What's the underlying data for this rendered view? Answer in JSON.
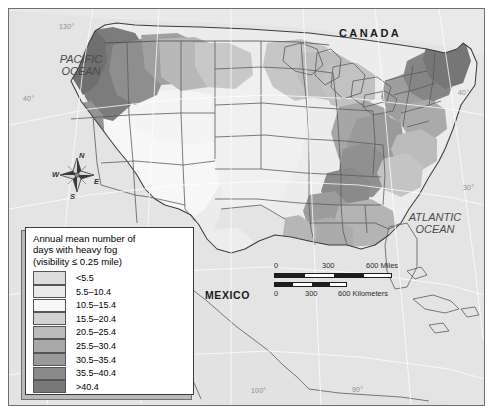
{
  "map": {
    "title_country_labels": [
      {
        "name": "CANADA",
        "x": 352,
        "y": 26,
        "style": "country"
      },
      {
        "name": "MEXICO",
        "x": 213,
        "y": 288,
        "style": "country-tight"
      }
    ],
    "ocean_labels": [
      {
        "name": "PACIFIC OCEAN",
        "line1": "PACIFIC",
        "line2": "OCEAN",
        "x": 30,
        "y": 52
      },
      {
        "name": "ATLANTIC OCEAN",
        "line1": "ATLANTIC",
        "line2": "OCEAN",
        "x": 415,
        "y": 215
      }
    ],
    "graticule_labels": [
      {
        "text": "130°",
        "x": 58,
        "y": 22
      },
      {
        "text": "40°",
        "x": 22,
        "y": 93
      },
      {
        "text": "40°",
        "x": 457,
        "y": 88
      },
      {
        "text": "30°",
        "x": 462,
        "y": 183
      },
      {
        "text": "100°",
        "x": 250,
        "y": 386
      },
      {
        "text": "90°",
        "x": 351,
        "y": 385
      }
    ],
    "compass": {
      "north": "N",
      "west": "W",
      "east": "E",
      "south": "S"
    },
    "scalebar": {
      "miles_label": "600 Miles",
      "kilometers_label": "600 Kilometers",
      "miles_ticks": [
        "0",
        "300",
        "600 Miles"
      ],
      "km_ticks": [
        "0",
        "300",
        "600 Kilometers"
      ],
      "miles_zero": "0",
      "miles_mid": "300",
      "km_zero": "0",
      "km_mid": "300"
    }
  },
  "legend": {
    "title_line1": "Annual mean number of",
    "title_line2": "days with heavy fog",
    "title_line3": "(visibility ≤ 0.25 mile)",
    "classes": [
      {
        "label": "<5.5",
        "color": "#dcdcdc"
      },
      {
        "label": "5.5–10.4",
        "color": "#e9e9e9"
      },
      {
        "label": "10.5–15.4",
        "color": "#f7f7f7"
      },
      {
        "label": "15.5–20.4",
        "color": "#d2d2d2"
      },
      {
        "label": "20.5–25.4",
        "color": "#bcbcbc"
      },
      {
        "label": "25.5–30.4",
        "color": "#a8a8a8"
      },
      {
        "label": "30.5–35.4",
        "color": "#9a9a9a"
      },
      {
        "label": "35.5–40.4",
        "color": "#8a8a8a"
      },
      {
        "label": ">40.4",
        "color": "#787878"
      }
    ]
  },
  "chart_data": {
    "type": "heatmap",
    "title": "Annual mean number of days with heavy fog (visibility ≤ 0.25 mile)",
    "units": "days per year",
    "classes": [
      "<5.5",
      "5.5–10.4",
      "10.5–15.4",
      "15.5–20.4",
      "20.5–25.4",
      "25.5–30.4",
      "30.5–35.4",
      "35.5–40.4",
      ">40.4"
    ],
    "class_colors": [
      "#dcdcdc",
      "#e9e9e9",
      "#f7f7f7",
      "#d2d2d2",
      "#bcbcbc",
      "#a8a8a8",
      "#9a9a9a",
      "#8a8a8a",
      "#787878"
    ],
    "regions": [
      {
        "name": "Pacific Northwest coast",
        "class": ">40.4"
      },
      {
        "name": "Maine / Northern New England",
        "class": ">40.4"
      },
      {
        "name": "Appalachian Mountains",
        "class": "35.5–40.4"
      },
      {
        "name": "Northern California coast",
        "class": "30.5–35.4"
      },
      {
        "name": "Gulf Coast / Lower Mississippi",
        "class": "25.5–30.4"
      },
      {
        "name": "Great Lakes / Upper Midwest",
        "class": "20.5–25.4"
      },
      {
        "name": "Southeast Piedmont",
        "class": "20.5–25.4"
      },
      {
        "name": "Great Plains",
        "class": "10.5–15.4"
      },
      {
        "name": "Desert Southwest",
        "class": "<5.5"
      },
      {
        "name": "Great Basin",
        "class": "<5.5"
      }
    ]
  }
}
